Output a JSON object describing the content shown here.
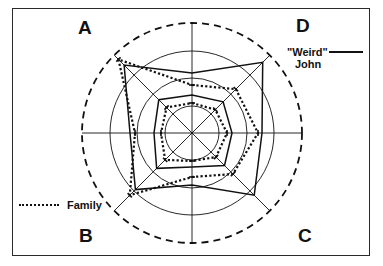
{
  "figure": {
    "type": "radar",
    "background": "#ffffff",
    "frame_color": "#2a2a2e",
    "line_color": "#111111"
  },
  "corner_labels": {
    "top_left": "A",
    "top_right": "D",
    "bottom_left": "B",
    "bottom_right": "C"
  },
  "legend": {
    "series1_label_line1": "\"Weird\"",
    "series1_label_line2": "John",
    "series1_style": "solid-line",
    "series2_label": "Family",
    "series2_style": "dotted-line"
  },
  "icons": {
    "solid-line-swatch": "solid-line-icon",
    "dotted-line-swatch": "dotted-line-icon"
  },
  "chart_data": {
    "type": "radar",
    "title": "",
    "xlabel": "",
    "ylabel": "",
    "center": [
      192,
      133
    ],
    "grid": true,
    "legend_position": "outside",
    "quadrant_labels": [
      "A",
      "D",
      "C",
      "B"
    ],
    "axes_count": 8,
    "axis_angles_deg": [
      90,
      45,
      0,
      315,
      270,
      225,
      180,
      135
    ],
    "radial_rings": [
      27,
      55,
      82
    ],
    "outer_ring": 110,
    "outer_ring_style": "dashed",
    "ring_style": "solid",
    "rmax": 110,
    "spoke_extent": [
      110,
      110,
      110,
      110,
      110,
      110,
      110,
      110
    ],
    "series": [
      {
        "name": "\"Weird\" John",
        "style": "solid",
        "values": [
          60,
          100,
          70,
          88,
          52,
          80,
          62,
          96
        ]
      },
      {
        "name": "Family",
        "style": "dotted",
        "values": [
          48,
          62,
          66,
          58,
          44,
          88,
          57,
          104
        ]
      },
      {
        "name": "\"Weird\" John inner",
        "style": "solid",
        "values": [
          38,
          44,
          40,
          46,
          34,
          50,
          38,
          47
        ]
      },
      {
        "name": "Family inner",
        "style": "dotted",
        "values": [
          30,
          33,
          35,
          34,
          28,
          38,
          31,
          36
        ]
      }
    ]
  }
}
